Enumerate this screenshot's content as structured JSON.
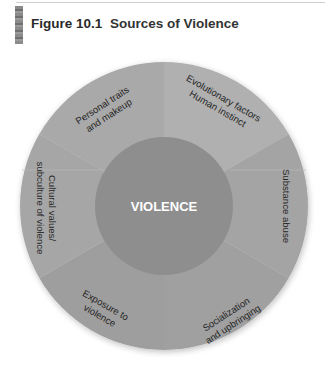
{
  "figure": {
    "number": "Figure 10.1",
    "title": "Sources of Violence"
  },
  "diagram": {
    "type": "wheel",
    "center": {
      "label": "VIOLENCE"
    },
    "segments": [
      {
        "id": "personal",
        "line1": "Personal traits",
        "line2": "and makeup"
      },
      {
        "id": "evolutionary",
        "line1": "Evolutionary factors",
        "line2": "Human instinct"
      },
      {
        "id": "substance",
        "line1": "Substance abuse",
        "line2": ""
      },
      {
        "id": "socialization",
        "line1": "Socialization",
        "line2": "and upbringing"
      },
      {
        "id": "exposure",
        "line1": "Exposure to",
        "line2": "violence"
      },
      {
        "id": "cultural",
        "line1": "Cultural values/",
        "line2": "subculture of violence"
      }
    ]
  },
  "colors": {
    "ring_light": "#ababab",
    "ring_mid": "#a2a2a2",
    "ring_dark": "#9b9b9b",
    "center": "#8e8e8e",
    "divider": "#b8b8b8"
  }
}
